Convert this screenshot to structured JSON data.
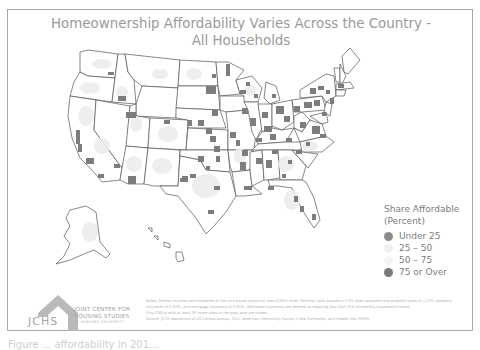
{
  "title": {
    "line1": "Homeownership Affordability Varies Across the Country -",
    "line2": "All Households"
  },
  "legend": {
    "title_line1": "Share Affordable",
    "title_line2": "(Percent)",
    "items": [
      {
        "label": "Under 25",
        "color": "#8c8c8c"
      },
      {
        "label": "25 – 50",
        "color": "#f0f0f0"
      },
      {
        "label": "50 – 75",
        "color": "#f4f4f4"
      },
      {
        "label": "75 or Over",
        "color": "#7a7a7a"
      }
    ]
  },
  "logo": {
    "abbr": "JCHS",
    "line1": "JOINT CENTER FOR",
    "line2": "HOUSING STUDIES",
    "line3": "OF HARVARD UNIVERSITY"
  },
  "notes": {
    "line1": "Notes: Median incomes are estimated at the core based statistical area (CBSA) level. Monthly costs assume a 3.5% down payment and property taxes of 1.15%, property",
    "line2": "insurance of 0.35%, and mortgage insurance of 0.85%. Affordable payments are defined as requiring less than 31% of monthly household income.",
    "line3": "Only CBSAs with at least 30 home sales in the past year are shown.",
    "line4": "Source: JCHS tabulations of US Census Bureau, 2017 American Community Survey 1-Year Estimates, and Freddie Mac PMMS."
  },
  "caption": "Figure ... affordability in 201...",
  "colors": {
    "frame_border": "#a8a8a8",
    "title": "#9a9a9a",
    "state_outline": "#555555",
    "under_25": "#8c8c8c",
    "mid_low": "#ebebeb",
    "mid_high": "#f2f2f2",
    "over_75": "#7a7a7a"
  }
}
